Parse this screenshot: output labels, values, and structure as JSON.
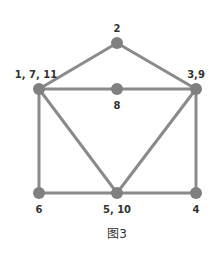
{
  "figure": {
    "caption": "图3",
    "colors": {
      "edge": "#8a8a8a",
      "node": "#808080",
      "label": "#333333",
      "background": "#ffffff"
    }
  },
  "nodes": [
    {
      "id": "n2",
      "label": "2",
      "x": 117,
      "y": 43,
      "lx": 117,
      "ly": 32
    },
    {
      "id": "n1711",
      "label": "1, 7, 11",
      "x": 39,
      "y": 89,
      "lx": 36,
      "ly": 78
    },
    {
      "id": "n8",
      "label": "8",
      "x": 117,
      "y": 89,
      "lx": 117,
      "ly": 109
    },
    {
      "id": "n39",
      "label": "3,9",
      "x": 196,
      "y": 89,
      "lx": 196,
      "ly": 78
    },
    {
      "id": "n6",
      "label": "6",
      "x": 39,
      "y": 193,
      "lx": 39,
      "ly": 213
    },
    {
      "id": "n510",
      "label": "5, 10",
      "x": 117,
      "y": 193,
      "lx": 117,
      "ly": 213
    },
    {
      "id": "n4",
      "label": "4",
      "x": 196,
      "y": 193,
      "lx": 196,
      "ly": 213
    }
  ],
  "edges": [
    [
      "n1711",
      "n2"
    ],
    [
      "n2",
      "n39"
    ],
    [
      "n1711",
      "n8"
    ],
    [
      "n8",
      "n39"
    ],
    [
      "n1711",
      "n6"
    ],
    [
      "n1711",
      "n510"
    ],
    [
      "n39",
      "n510"
    ],
    [
      "n39",
      "n4"
    ],
    [
      "n6",
      "n510"
    ],
    [
      "n510",
      "n4"
    ]
  ]
}
